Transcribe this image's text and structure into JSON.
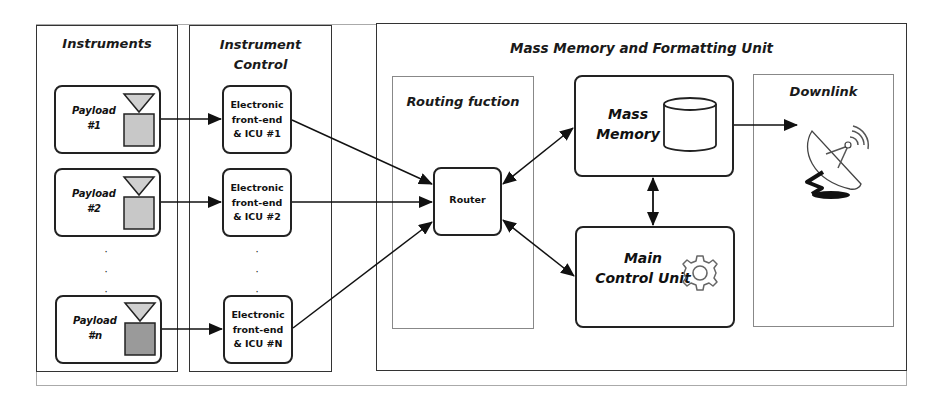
{
  "outer_frame": {
    "visible": true
  },
  "instruments": {
    "title": "Instruments",
    "payloads": [
      {
        "label_line1": "Payload",
        "label_line2": "#1",
        "square_color": "#c8c8c8"
      },
      {
        "label_line1": "Payload",
        "label_line2": "#2",
        "square_color": "#c8c8c8"
      },
      {
        "label_line1": "Payload",
        "label_line2": "#n",
        "square_color": "#9a9a9a"
      }
    ],
    "ellipsis": "· · ·"
  },
  "instrument_control": {
    "title_line1": "Instrument",
    "title_line2": "Control",
    "units": [
      {
        "line1": "Electronic",
        "line2": "front-end",
        "line3": "& ICU #1"
      },
      {
        "line1": "Electronic",
        "line2": "front-end",
        "line3": "& ICU #2"
      },
      {
        "line1": "Electronic",
        "line2": "front-end",
        "line3": "& ICU #N"
      }
    ]
  },
  "mmfu": {
    "title": "Mass Memory and Formatting Unit",
    "routing": {
      "title": "Routing fuction",
      "router_label": "Router"
    },
    "mass_memory": {
      "line1": "Mass",
      "line2": "Memory",
      "icon": "database-icon"
    },
    "main_control": {
      "line1": "Main",
      "line2": "Control Unit",
      "icon": "gear-icon"
    },
    "downlink": {
      "title": "Downlink",
      "icon": "satellite-dish-icon"
    }
  }
}
